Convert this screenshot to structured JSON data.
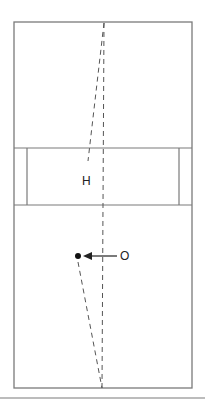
{
  "diagram": {
    "colors": {
      "stroke": "#7a7a7a",
      "dash": "#555555",
      "dot": "#111111",
      "arrow": "#222222",
      "text": "#222222"
    },
    "labels": {
      "h": "H",
      "o": "O"
    },
    "court": {
      "outer": {
        "x1": 14,
        "y1": 22,
        "x2": 192,
        "y2": 388
      },
      "band": {
        "y1": 148,
        "y2": 205,
        "inner_left_x": 27,
        "inner_right_x": 179
      }
    },
    "lines": {
      "center_dashed": {
        "x1": 104,
        "y1": 22,
        "x2": 102,
        "y2": 388
      },
      "upper_slanted_dashed": {
        "x1": 104,
        "y1": 22,
        "x2": 88,
        "y2": 160
      },
      "lower_slanted_dashed": {
        "x1": 78,
        "y1": 262,
        "x2": 102,
        "y2": 388
      },
      "separator": {
        "x1": 0,
        "y1": 398,
        "x2": 205,
        "y2": 398
      }
    },
    "marker": {
      "dot_x": 78,
      "dot_y": 256
    },
    "arrow": {
      "from_x": 117,
      "to_x": 84,
      "y": 256
    },
    "label_positions": {
      "h": {
        "x": 82,
        "y": 176
      },
      "o": {
        "x": 120,
        "y": 250
      }
    }
  }
}
